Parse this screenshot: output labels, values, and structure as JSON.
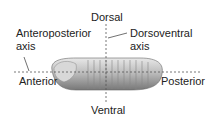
{
  "diagram": {
    "labels": {
      "dorsal": "Dorsal",
      "ventral": "Ventral",
      "anterior": "Anterior",
      "posterior": "Posterior",
      "ap_axis_line1": "Anteroposterior",
      "ap_axis_line2": "axis",
      "dv_axis_line1": "Dorsoventral",
      "dv_axis_line2": "axis"
    }
  }
}
